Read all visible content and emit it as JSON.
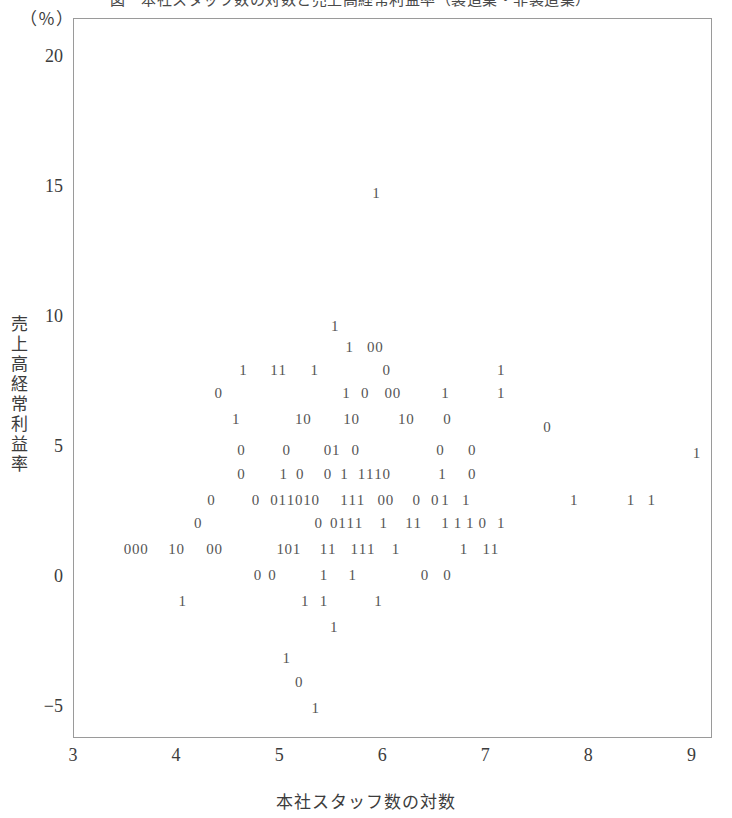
{
  "figure": {
    "title_cropped": "図　本社スタッフ数の対数と売上高経常利益率（製造業・非製造業）",
    "unit_label": "（％）",
    "y_axis_title": "売上高経常利益率",
    "x_axis_title": "本社スタッフ数の対数"
  },
  "chart_data": {
    "type": "scatter",
    "title": "図　本社スタッフ数の対数と売上高経常利益率（製造業・非製造業）",
    "xlabel": "本社スタッフ数の対数",
    "ylabel": "売上高経常利益率",
    "yunit": "（％）",
    "xlim": [
      3,
      9.2
    ],
    "ylim": [
      -6.2,
      21.5
    ],
    "xticks": [
      3,
      4,
      5,
      6,
      7,
      8,
      9
    ],
    "yticks": [
      20,
      15,
      10,
      5,
      0,
      -5
    ],
    "ytick_labels": [
      "20",
      "15",
      "10",
      "5",
      "0",
      "-5"
    ],
    "grid": false,
    "legend": "none",
    "marker_style": "digit-glyph",
    "marker_note": "Each observation is plotted as the digit character of its group code (0 or 1) rather than a symbol.",
    "groups": [
      {
        "code": "0",
        "label": "0"
      },
      {
        "code": "1",
        "label": "1"
      }
    ],
    "points": [
      {
        "x": 5.93,
        "y": 14.8,
        "g": "1"
      },
      {
        "x": 5.53,
        "y": 9.7,
        "g": "1"
      },
      {
        "x": 5.67,
        "y": 8.9,
        "g": "1"
      },
      {
        "x": 5.88,
        "y": 8.9,
        "g": "0"
      },
      {
        "x": 5.96,
        "y": 8.9,
        "g": "0"
      },
      {
        "x": 4.64,
        "y": 8.0,
        "g": "1"
      },
      {
        "x": 4.94,
        "y": 8.0,
        "g": "1"
      },
      {
        "x": 5.02,
        "y": 8.0,
        "g": "1"
      },
      {
        "x": 5.33,
        "y": 8.0,
        "g": "1"
      },
      {
        "x": 6.03,
        "y": 8.0,
        "g": "0"
      },
      {
        "x": 7.14,
        "y": 8.0,
        "g": "1"
      },
      {
        "x": 4.4,
        "y": 7.1,
        "g": "0"
      },
      {
        "x": 5.64,
        "y": 7.1,
        "g": "1"
      },
      {
        "x": 5.82,
        "y": 7.1,
        "g": "0"
      },
      {
        "x": 6.05,
        "y": 7.1,
        "g": "0"
      },
      {
        "x": 6.13,
        "y": 7.1,
        "g": "0"
      },
      {
        "x": 6.6,
        "y": 7.1,
        "g": "1"
      },
      {
        "x": 7.14,
        "y": 7.1,
        "g": "1"
      },
      {
        "x": 4.57,
        "y": 6.1,
        "g": "1"
      },
      {
        "x": 5.18,
        "y": 6.1,
        "g": "1"
      },
      {
        "x": 5.26,
        "y": 6.1,
        "g": "0"
      },
      {
        "x": 5.65,
        "y": 6.1,
        "g": "1"
      },
      {
        "x": 5.73,
        "y": 6.1,
        "g": "0"
      },
      {
        "x": 6.18,
        "y": 6.1,
        "g": "1"
      },
      {
        "x": 6.26,
        "y": 6.1,
        "g": "0"
      },
      {
        "x": 6.62,
        "y": 6.1,
        "g": "0"
      },
      {
        "x": 7.59,
        "y": 5.8,
        "g": "0"
      },
      {
        "x": 4.62,
        "y": 4.9,
        "g": "0"
      },
      {
        "x": 5.06,
        "y": 4.9,
        "g": "0"
      },
      {
        "x": 5.46,
        "y": 4.9,
        "g": "0"
      },
      {
        "x": 5.54,
        "y": 4.9,
        "g": "1"
      },
      {
        "x": 5.73,
        "y": 4.9,
        "g": "0"
      },
      {
        "x": 6.55,
        "y": 4.9,
        "g": "0"
      },
      {
        "x": 6.86,
        "y": 4.9,
        "g": "0"
      },
      {
        "x": 9.04,
        "y": 4.8,
        "g": "1"
      },
      {
        "x": 4.62,
        "y": 4.0,
        "g": "0"
      },
      {
        "x": 5.03,
        "y": 4.0,
        "g": "1"
      },
      {
        "x": 5.19,
        "y": 4.0,
        "g": "0"
      },
      {
        "x": 5.46,
        "y": 4.0,
        "g": "0"
      },
      {
        "x": 5.62,
        "y": 4.0,
        "g": "1"
      },
      {
        "x": 5.79,
        "y": 4.0,
        "g": "1"
      },
      {
        "x": 5.87,
        "y": 4.0,
        "g": "1"
      },
      {
        "x": 5.95,
        "y": 4.0,
        "g": "1"
      },
      {
        "x": 6.03,
        "y": 4.0,
        "g": "0"
      },
      {
        "x": 6.57,
        "y": 4.0,
        "g": "1"
      },
      {
        "x": 6.86,
        "y": 4.0,
        "g": "0"
      },
      {
        "x": 4.33,
        "y": 3.0,
        "g": "0"
      },
      {
        "x": 4.76,
        "y": 3.0,
        "g": "0"
      },
      {
        "x": 4.94,
        "y": 3.0,
        "g": "0"
      },
      {
        "x": 5.02,
        "y": 3.0,
        "g": "1"
      },
      {
        "x": 5.1,
        "y": 3.0,
        "g": "1"
      },
      {
        "x": 5.18,
        "y": 3.0,
        "g": "0"
      },
      {
        "x": 5.26,
        "y": 3.0,
        "g": "1"
      },
      {
        "x": 5.34,
        "y": 3.0,
        "g": "0"
      },
      {
        "x": 5.62,
        "y": 3.0,
        "g": "1"
      },
      {
        "x": 5.7,
        "y": 3.0,
        "g": "1"
      },
      {
        "x": 5.78,
        "y": 3.0,
        "g": "1"
      },
      {
        "x": 5.98,
        "y": 3.0,
        "g": "0"
      },
      {
        "x": 6.06,
        "y": 3.0,
        "g": "0"
      },
      {
        "x": 6.32,
        "y": 3.0,
        "g": "0"
      },
      {
        "x": 6.5,
        "y": 3.0,
        "g": "0"
      },
      {
        "x": 6.6,
        "y": 3.0,
        "g": "1"
      },
      {
        "x": 6.8,
        "y": 3.0,
        "g": "1"
      },
      {
        "x": 7.85,
        "y": 3.0,
        "g": "1"
      },
      {
        "x": 8.4,
        "y": 3.0,
        "g": "1"
      },
      {
        "x": 8.6,
        "y": 3.0,
        "g": "1"
      },
      {
        "x": 4.2,
        "y": 2.1,
        "g": "0"
      },
      {
        "x": 5.37,
        "y": 2.1,
        "g": "0"
      },
      {
        "x": 5.52,
        "y": 2.1,
        "g": "0"
      },
      {
        "x": 5.6,
        "y": 2.1,
        "g": "1"
      },
      {
        "x": 5.68,
        "y": 2.1,
        "g": "1"
      },
      {
        "x": 5.76,
        "y": 2.1,
        "g": "1"
      },
      {
        "x": 6.0,
        "y": 2.1,
        "g": "1"
      },
      {
        "x": 6.25,
        "y": 2.1,
        "g": "1"
      },
      {
        "x": 6.33,
        "y": 2.1,
        "g": "1"
      },
      {
        "x": 6.6,
        "y": 2.1,
        "g": "1"
      },
      {
        "x": 6.72,
        "y": 2.1,
        "g": "1"
      },
      {
        "x": 6.84,
        "y": 2.1,
        "g": "1"
      },
      {
        "x": 6.96,
        "y": 2.1,
        "g": "0"
      },
      {
        "x": 7.14,
        "y": 2.1,
        "g": "1"
      },
      {
        "x": 3.52,
        "y": 1.1,
        "g": "0"
      },
      {
        "x": 3.6,
        "y": 1.1,
        "g": "0"
      },
      {
        "x": 3.68,
        "y": 1.1,
        "g": "0"
      },
      {
        "x": 3.95,
        "y": 1.1,
        "g": "1"
      },
      {
        "x": 4.03,
        "y": 1.1,
        "g": "0"
      },
      {
        "x": 4.32,
        "y": 1.1,
        "g": "0"
      },
      {
        "x": 4.4,
        "y": 1.1,
        "g": "0"
      },
      {
        "x": 5.0,
        "y": 1.1,
        "g": "1"
      },
      {
        "x": 5.08,
        "y": 1.1,
        "g": "0"
      },
      {
        "x": 5.16,
        "y": 1.1,
        "g": "1"
      },
      {
        "x": 5.42,
        "y": 1.1,
        "g": "1"
      },
      {
        "x": 5.5,
        "y": 1.1,
        "g": "1"
      },
      {
        "x": 5.72,
        "y": 1.1,
        "g": "1"
      },
      {
        "x": 5.8,
        "y": 1.1,
        "g": "1"
      },
      {
        "x": 5.88,
        "y": 1.1,
        "g": "1"
      },
      {
        "x": 6.12,
        "y": 1.1,
        "g": "1"
      },
      {
        "x": 6.78,
        "y": 1.1,
        "g": "1"
      },
      {
        "x": 7.0,
        "y": 1.1,
        "g": "1"
      },
      {
        "x": 7.08,
        "y": 1.1,
        "g": "1"
      },
      {
        "x": 4.78,
        "y": 0.1,
        "g": "0"
      },
      {
        "x": 4.92,
        "y": 0.1,
        "g": "0"
      },
      {
        "x": 5.42,
        "y": 0.1,
        "g": "1"
      },
      {
        "x": 5.7,
        "y": 0.1,
        "g": "1"
      },
      {
        "x": 6.4,
        "y": 0.1,
        "g": "0"
      },
      {
        "x": 6.62,
        "y": 0.1,
        "g": "0"
      },
      {
        "x": 4.05,
        "y": -0.9,
        "g": "1"
      },
      {
        "x": 5.24,
        "y": -0.9,
        "g": "1"
      },
      {
        "x": 5.42,
        "y": -0.9,
        "g": "1"
      },
      {
        "x": 5.95,
        "y": -0.9,
        "g": "1"
      },
      {
        "x": 5.52,
        "y": -1.9,
        "g": "1"
      },
      {
        "x": 5.06,
        "y": -3.1,
        "g": "1"
      },
      {
        "x": 5.18,
        "y": -4.0,
        "g": "0"
      },
      {
        "x": 5.34,
        "y": -5.0,
        "g": "1"
      }
    ]
  },
  "axes": {
    "y_ticks": [
      {
        "label": "20",
        "value": 20
      },
      {
        "label": "15",
        "value": 15
      },
      {
        "label": "10",
        "value": 10
      },
      {
        "label": "5",
        "value": 5
      },
      {
        "label": "0",
        "value": 0
      },
      {
        "label": "-5",
        "value": -5
      }
    ],
    "x_ticks": [
      {
        "label": "3",
        "value": 3
      },
      {
        "label": "4",
        "value": 4
      },
      {
        "label": "5",
        "value": 5
      },
      {
        "label": "6",
        "value": 6
      },
      {
        "label": "7",
        "value": 7
      },
      {
        "label": "8",
        "value": 8
      },
      {
        "label": "9",
        "value": 9
      }
    ]
  }
}
